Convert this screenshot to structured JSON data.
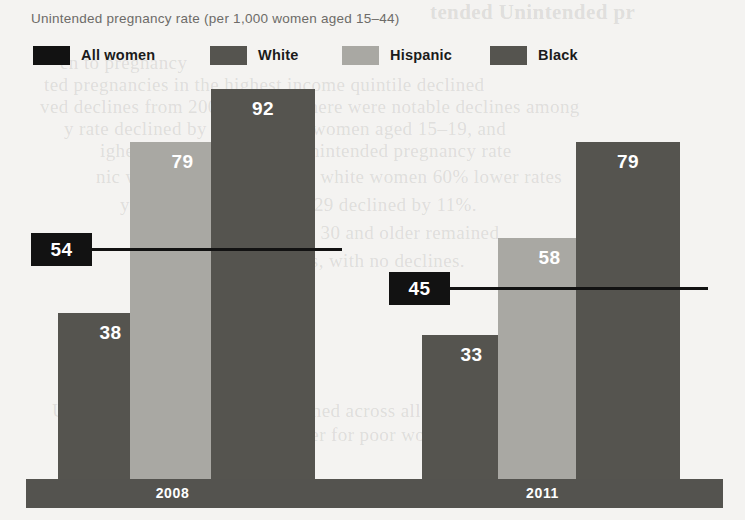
{
  "chart_data": {
    "type": "bar",
    "title": "Unintended pregnancy rate (per 1,000 women aged 15–44)",
    "xlabel": "",
    "ylabel": "",
    "ylim": [
      0,
      100
    ],
    "grid": false,
    "legend_position": "top-left",
    "categories": [
      "2008",
      "2011"
    ],
    "series": [
      {
        "name": "White",
        "color": "#55544f",
        "values": [
          38,
          33
        ]
      },
      {
        "name": "Hispanic",
        "color": "#a9a8a3",
        "values": [
          79,
          58
        ]
      },
      {
        "name": "Black",
        "color": "#55544f",
        "values": [
          92,
          79
        ]
      }
    ],
    "reference_series": {
      "name": "All women",
      "color": "#121212",
      "values": [
        54,
        45
      ]
    },
    "legend": [
      {
        "label": "All women",
        "color": "#121212"
      },
      {
        "label": "White",
        "color": "#55544f"
      },
      {
        "label": "Hispanic",
        "color": "#a9a8a3"
      },
      {
        "label": "Black",
        "color": "#55544f"
      }
    ],
    "bars": [
      {
        "group": "2008",
        "series": "White",
        "value": 38,
        "label": "38",
        "color": "#55544f",
        "x": 58,
        "width": 105,
        "top": 313
      },
      {
        "group": "2008",
        "series": "Hispanic",
        "value": 79,
        "label": "79",
        "color": "#a9a8a3",
        "x": 130,
        "width": 105,
        "top": 142
      },
      {
        "group": "2008",
        "series": "Black",
        "value": 92,
        "label": "92",
        "color": "#55544f",
        "x": 211,
        "width": 104,
        "top": 89
      },
      {
        "group": "2011",
        "series": "White",
        "value": 33,
        "label": "33",
        "color": "#55544f",
        "x": 422,
        "width": 99,
        "top": 335
      },
      {
        "group": "2011",
        "series": "Hispanic",
        "value": 58,
        "label": "58",
        "color": "#a9a8a3",
        "x": 498,
        "width": 103,
        "top": 238
      },
      {
        "group": "2011",
        "series": "Black",
        "value": 79,
        "label": "79",
        "color": "#55544f",
        "x": 576,
        "width": 104,
        "top": 142
      }
    ],
    "reference_markers": [
      {
        "group": "2008",
        "value": 54,
        "label": "54",
        "badge_x": 31,
        "badge_y": 233,
        "badge_w": 61,
        "badge_h": 33,
        "line_x": 92,
        "line_w": 250,
        "line_y": 248
      },
      {
        "group": "2011",
        "value": 45,
        "label": "45",
        "badge_x": 389,
        "badge_y": 272,
        "badge_w": 61,
        "badge_h": 33,
        "line_x": 450,
        "line_w": 258,
        "line_y": 287
      }
    ],
    "axis_ticks": [
      {
        "label": "2008",
        "x": 120,
        "width": 105
      },
      {
        "label": "2011",
        "x": 490,
        "width": 105
      }
    ]
  },
  "page_bleed": [
    {
      "text": "tended Unintended pr",
      "x": 430,
      "y": 0,
      "variant": "b-top"
    },
    {
      "text": "en to pregnancy",
      "x": 60,
      "y": 52,
      "variant": ""
    },
    {
      "text": "ted pregnancies in the highest income quintile declined",
      "x": 44,
      "y": 74,
      "variant": ""
    },
    {
      "text": "ved declines from 2008 to 2011, there were notable declines among",
      "x": 40,
      "y": 96,
      "variant": ""
    },
    {
      "text": "y rate declined by 22% among women aged 15–19, and",
      "x": 64,
      "y": 118,
      "variant": ""
    },
    {
      "text": "ighest rate in 2011, their unintended pregnancy rate",
      "x": 100,
      "y": 140,
      "variant": ""
    },
    {
      "text": "nic women have a 71% and white women 60% lower rates",
      "x": 96,
      "y": 166,
      "variant": ""
    },
    {
      "text": "y rates among those 25–29 declined by 11%.",
      "x": 120,
      "y": 194,
      "variant": ""
    },
    {
      "text": "ates for women aged 30 and older remained",
      "x": 150,
      "y": 222,
      "variant": ""
    },
    {
      "text": "stable in recent years, with no declines.",
      "x": 150,
      "y": 250,
      "variant": ""
    },
    {
      "text": "disparities",
      "x": 76,
      "y": 310,
      "variant": "b-top"
    },
    {
      "text": "remain substantial",
      "x": 60,
      "y": 338,
      "variant": ""
    },
    {
      "text": "Unintended pregnancy rate declined across all income levels",
      "x": 52,
      "y": 400,
      "variant": ""
    },
    {
      "text": "hough the rate remains far higher for poor women",
      "x": 60,
      "y": 424,
      "variant": ""
    }
  ]
}
